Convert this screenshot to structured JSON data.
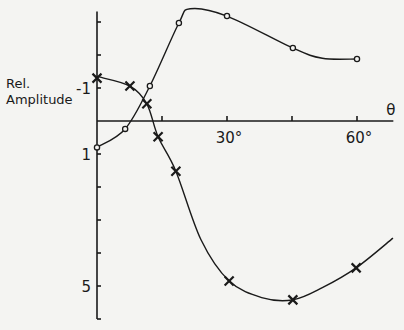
{
  "chart_data": {
    "type": "line",
    "title": "",
    "xlabel": "θ",
    "ylabel": "Rel. Amplitude",
    "ylabel_lines": [
      "Rel.",
      "Amplitude"
    ],
    "x_unit": "°",
    "xlim": [
      0,
      70
    ],
    "ylim": [
      -3.5,
      6
    ],
    "y_inverted": true,
    "grid": false,
    "x_ticks": [
      15,
      30,
      45,
      60
    ],
    "x_tick_labels": [
      {
        "value": 30,
        "label": "30°"
      },
      {
        "value": 60,
        "label": "60°"
      }
    ],
    "y_ticks": [
      -3,
      -2,
      -1,
      1,
      2,
      3,
      4,
      5,
      6
    ],
    "y_tick_labels": [
      {
        "value": -1,
        "label": "-1"
      },
      {
        "value": 1,
        "label": "1"
      },
      {
        "value": 5,
        "label": "5"
      }
    ],
    "series": [
      {
        "name": "circles",
        "marker": "circle",
        "points": [
          [
            0,
            0.8
          ],
          [
            6.5,
            0.24
          ],
          [
            12.2,
            -1.06
          ],
          [
            18.9,
            -2.97
          ],
          [
            30,
            -3.18
          ],
          [
            45.2,
            -2.21
          ],
          [
            60,
            -1.88
          ]
        ],
        "curve": [
          [
            0,
            0.8
          ],
          [
            6.5,
            0.24
          ],
          [
            12.2,
            -1.06
          ],
          [
            18.9,
            -2.97
          ],
          [
            21.5,
            -3.4
          ],
          [
            30,
            -3.18
          ],
          [
            45.2,
            -2.21
          ],
          [
            52,
            -1.9
          ],
          [
            60,
            -1.88
          ]
        ]
      },
      {
        "name": "crosses",
        "marker": "x",
        "points": [
          [
            0,
            -1.3
          ],
          [
            7.6,
            -1.06
          ],
          [
            11.5,
            -0.52
          ],
          [
            14.1,
            0.48
          ],
          [
            18.2,
            1.52
          ],
          [
            30.5,
            4.85
          ],
          [
            45.2,
            5.42
          ],
          [
            59.8,
            4.45
          ]
        ],
        "curve": [
          [
            0,
            -1.35
          ],
          [
            7.6,
            -1.06
          ],
          [
            11.5,
            -0.52
          ],
          [
            14.1,
            0.48
          ],
          [
            18.2,
            1.52
          ],
          [
            24,
            3.6
          ],
          [
            30.5,
            4.85
          ],
          [
            38,
            5.35
          ],
          [
            45.2,
            5.42
          ],
          [
            52,
            5.05
          ],
          [
            59.8,
            4.45
          ],
          [
            68.3,
            3.55
          ]
        ]
      }
    ]
  }
}
